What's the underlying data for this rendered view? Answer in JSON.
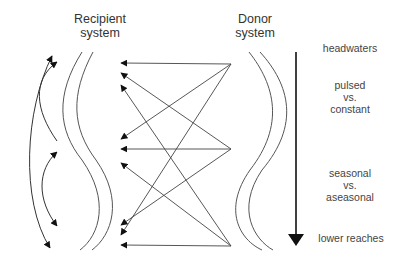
{
  "diagram": {
    "recipient": {
      "line1": "Recipient",
      "line2": "system"
    },
    "donor": {
      "line1": "Donor",
      "line2": "system"
    },
    "gradient": {
      "top": "headwaters",
      "middle1": {
        "line1": "pulsed",
        "line2": "vs.",
        "line3": "constant"
      },
      "middle2": {
        "line1": "seasonal",
        "line2": "vs.",
        "line3": "aseasonal"
      },
      "bottom": "lower reaches"
    },
    "colors": {
      "line": "#555555",
      "arrow": "#111111",
      "text": "#333333"
    },
    "connections": {
      "sources": [
        {
          "name": "donor-top",
          "x": 231,
          "y": 64
        },
        {
          "name": "donor-middle",
          "x": 231,
          "y": 149
        },
        {
          "name": "donor-bottom",
          "x": 231,
          "y": 246
        }
      ],
      "targets_y": [
        63,
        73,
        85,
        139,
        149,
        163,
        225,
        235,
        245
      ]
    }
  }
}
